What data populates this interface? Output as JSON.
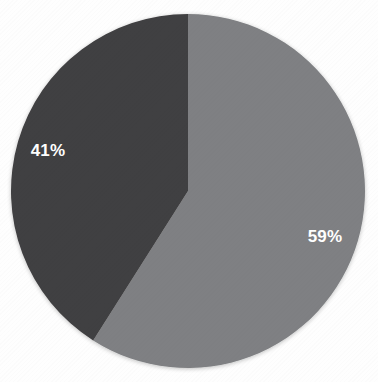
{
  "chart_data": {
    "type": "pie",
    "title": "",
    "subtitle": "",
    "xlabel": "",
    "ylabel": "",
    "legend": "none",
    "grid": false,
    "start_angle_deg": 0,
    "direction": "clockwise",
    "background_color": "#ffffff",
    "label_color": "#ffffff",
    "categories": [
      "Series 1",
      "Series 2"
    ],
    "values": [
      59,
      41
    ],
    "labels": [
      "59%",
      "41%"
    ],
    "colors": [
      "#7f8083",
      "#414042"
    ],
    "slices": [
      {
        "name": "slice-1",
        "label": "59%",
        "value": 59,
        "color": "#7f8083",
        "start_deg": 0,
        "sweep_deg": 212.4,
        "label_x": 325,
        "label_y": 238
      },
      {
        "name": "slice-2",
        "label": "41%",
        "value": 41,
        "color": "#414042",
        "start_deg": 212.4,
        "sweep_deg": 147.6,
        "label_x": 48,
        "label_y": 152
      }
    ],
    "geometry": {
      "center_x": 188,
      "center_y": 191,
      "radius": 177
    }
  }
}
